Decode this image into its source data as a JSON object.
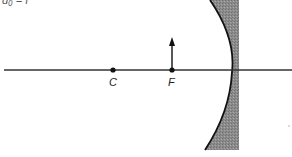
{
  "diagram": {
    "type": "concave-mirror-ray-diagram",
    "partial_label": "d₀ = f",
    "points": [
      {
        "id": "C",
        "label": "C",
        "x": 113,
        "y": 70
      },
      {
        "id": "F",
        "label": "F",
        "x": 172,
        "y": 70
      }
    ],
    "object_arrow": {
      "x": 172,
      "y_base": 70,
      "y_tip": 38
    },
    "principal_axis": {
      "y": 70,
      "x_start": 4,
      "x_end": 292
    },
    "mirror": {
      "vertex_x": 232,
      "back_x": 239,
      "top_y": 0,
      "bottom_y": 150,
      "fill": "#8a8a8a"
    }
  }
}
